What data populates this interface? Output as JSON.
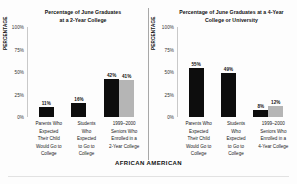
{
  "footer": {
    "group_label": "AFRICAN AMERICAN"
  },
  "axis": {
    "ylabel": "PERCENTAGE",
    "ticks": [
      "100%",
      "75%",
      "50%",
      "25%",
      "0%"
    ]
  },
  "chart_data": [
    {
      "type": "bar",
      "title": "Percentage of June Graduates at a 2-Year College",
      "title_line1": "Percentage of June Graduates",
      "title_line2": "at a 2-Year College",
      "xlabel": "",
      "ylabel": "PERCENTAGE",
      "ylim": [
        0,
        100
      ],
      "yticks": [
        100,
        75,
        50,
        25,
        0
      ],
      "ytick_labels": [
        "100%",
        "75%",
        "50%",
        "25%",
        "0%"
      ],
      "grid": false,
      "legend": "none",
      "categories": [
        "Parents Who Expected Their Child Would Go to College",
        "Students Who Expected to Go to College",
        "1999–2000 Seniors Who Enrolled in a 2-Year College"
      ],
      "groups": [
        {
          "category_lines": [
            "Parents Who",
            "Expected",
            "Their Child",
            "Would Go to",
            "College"
          ],
          "bars": [
            {
              "value": 11,
              "label": "11%",
              "color": "#0d0d0d",
              "shade": "dark"
            }
          ]
        },
        {
          "category_lines": [
            "Students",
            "Who",
            "Expected",
            "to Go to",
            "College"
          ],
          "bars": [
            {
              "value": 16,
              "label": "16%",
              "color": "#0d0d0d",
              "shade": "dark"
            }
          ]
        },
        {
          "category_lines": [
            "1999–2000",
            "Seniors Who",
            "Enrolled in a",
            "2-Year College"
          ],
          "bars": [
            {
              "value": 42,
              "label": "42%",
              "color": "#0d0d0d",
              "shade": "dark"
            },
            {
              "value": 41,
              "label": "41%",
              "color": "#b5b5b5",
              "shade": "light"
            }
          ]
        }
      ]
    },
    {
      "type": "bar",
      "title": "Percentage of June Graduates at a 4-Year College or University",
      "title_line1": "Percentage of June Graduates at a 4-Year",
      "title_line2": "College or University",
      "xlabel": "",
      "ylabel": "PERCENTAGE",
      "ylim": [
        0,
        100
      ],
      "yticks": [
        100,
        75,
        50,
        25,
        0
      ],
      "ytick_labels": [
        "100%",
        "75%",
        "50%",
        "25%",
        "0%"
      ],
      "grid": false,
      "legend": "none",
      "categories": [
        "Parents Who Expected Their Child Would Go to College",
        "Students Who Expected to Go to College",
        "1999–2000 Seniors Who Enrolled in a 4-Year College"
      ],
      "groups": [
        {
          "category_lines": [
            "Parents Who",
            "Expected",
            "Their Child",
            "Would Go to",
            "College"
          ],
          "bars": [
            {
              "value": 55,
              "label": "55%",
              "color": "#0d0d0d",
              "shade": "dark"
            }
          ]
        },
        {
          "category_lines": [
            "Students",
            "Who",
            "Expected",
            "to Go to",
            "College"
          ],
          "bars": [
            {
              "value": 49,
              "label": "49%",
              "color": "#0d0d0d",
              "shade": "dark"
            }
          ]
        },
        {
          "category_lines": [
            "1999–2000",
            "Seniors Who",
            "Enrolled in a",
            "4-Year College"
          ],
          "bars": [
            {
              "value": 8,
              "label": "8%",
              "color": "#0d0d0d",
              "shade": "dark"
            },
            {
              "value": 12,
              "label": "12%",
              "color": "#b5b5b5",
              "shade": "light"
            }
          ]
        }
      ]
    }
  ]
}
